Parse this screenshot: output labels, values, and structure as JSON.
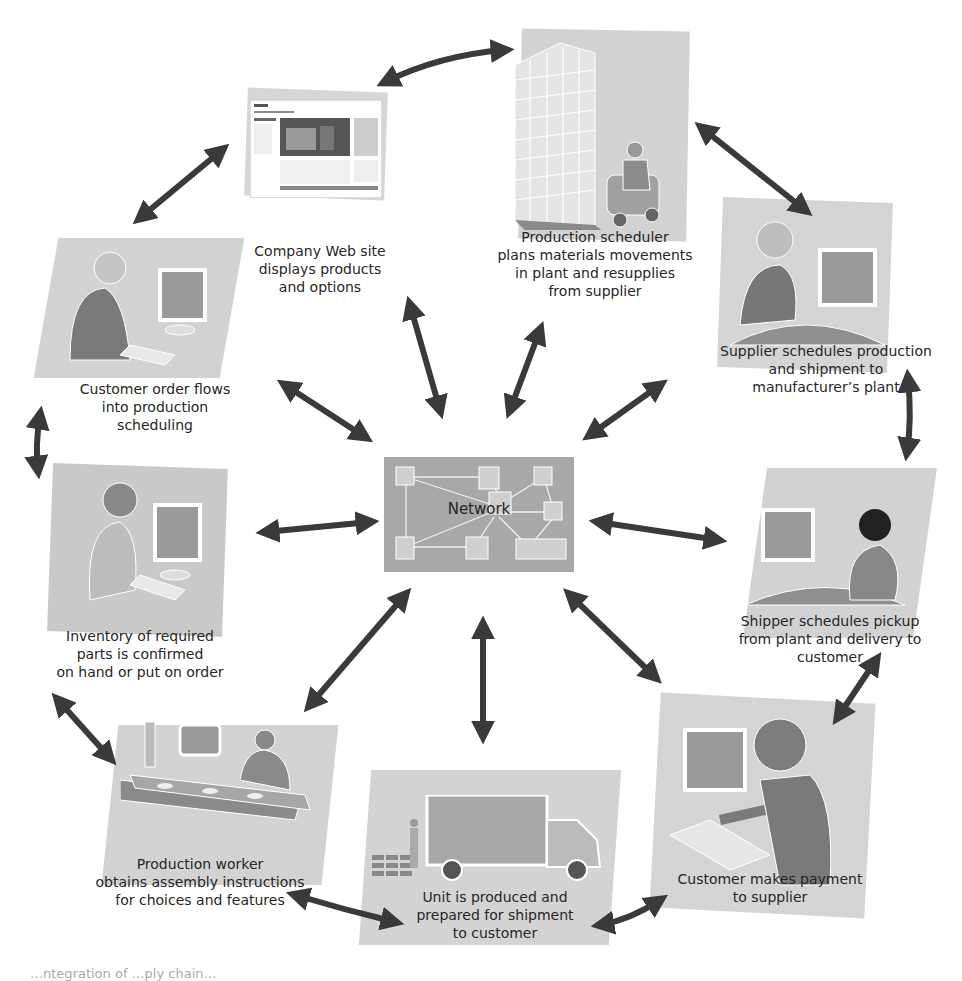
{
  "diagram": {
    "type": "network-hub flow diagram",
    "center": {
      "id": "network",
      "label": "Network"
    },
    "nodes": [
      {
        "id": "website",
        "label": "Company Web site\ndisplays products\nand options"
      },
      {
        "id": "scheduler",
        "label": "Production scheduler\nplans materials movements\nin plant and resupplies\nfrom supplier"
      },
      {
        "id": "supplier",
        "label": "Supplier schedules production\nand shipment to\nmanufacturer’s plant"
      },
      {
        "id": "shipper",
        "label": "Shipper schedules pickup\nfrom plant and delivery to\ncustomer"
      },
      {
        "id": "payment",
        "label": "Customer makes payment\nto supplier"
      },
      {
        "id": "unit",
        "label": "Unit is produced and\nprepared for shipment\nto customer"
      },
      {
        "id": "worker",
        "label": "Production worker\nobtains assembly instructions\nfor choices and features"
      },
      {
        "id": "inventory",
        "label": "Inventory of required\nparts is confirmed\non hand or put on order"
      },
      {
        "id": "order",
        "label": "Customer order flows\ninto production\nscheduling"
      }
    ],
    "ring_edges": [
      [
        "website",
        "scheduler"
      ],
      [
        "scheduler",
        "supplier"
      ],
      [
        "supplier",
        "shipper"
      ],
      [
        "shipper",
        "payment"
      ],
      [
        "payment",
        "unit"
      ],
      [
        "unit",
        "worker"
      ],
      [
        "worker",
        "inventory"
      ],
      [
        "inventory",
        "order"
      ],
      [
        "order",
        "website"
      ]
    ],
    "hub_edges": [
      "website",
      "scheduler",
      "supplier",
      "shipper",
      "payment",
      "unit",
      "worker",
      "inventory",
      "order"
    ],
    "edge_style": "double-headed arrow",
    "colors": {
      "panel": "#cfcfcf",
      "figure_dark": "#7a7a7a",
      "arrow": "#3a3a3a",
      "background": "#ffffff"
    }
  },
  "caption": "…ntegration of …ply chain…"
}
